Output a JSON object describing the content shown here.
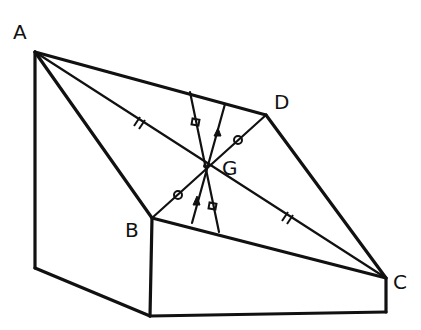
{
  "diagram": {
    "type": "geometry-figure",
    "stroke_color": "#111111",
    "background": "#ffffff",
    "points": {
      "A": {
        "label": "A",
        "x": 35,
        "y": 52
      },
      "B": {
        "label": "B",
        "x": 152,
        "y": 218
      },
      "C": {
        "label": "C",
        "x": 386,
        "y": 278
      },
      "D": {
        "label": "D",
        "x": 266,
        "y": 115
      },
      "G": {
        "label": "G",
        "x": 205,
        "y": 166
      }
    },
    "labels": {
      "A": "A",
      "B": "B",
      "C": "C",
      "D": "D",
      "G": "G"
    },
    "tick_marks": {
      "AG": "double-tick",
      "GC": "double-tick",
      "BG": "circle",
      "GD": "circle",
      "square_line": "square",
      "arrow_line": "arrow"
    }
  }
}
